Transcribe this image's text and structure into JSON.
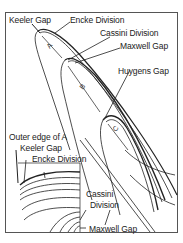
{
  "diagram": {
    "main_labels": [
      {
        "id": "keeler-gap",
        "text": "Keeler Gap"
      },
      {
        "id": "encke-division",
        "text": "Encke Division"
      },
      {
        "id": "cassini-division",
        "text": "Cassini Division"
      },
      {
        "id": "maxwell-gap",
        "text": "Maxwell Gap"
      },
      {
        "id": "huygens-gap",
        "text": "Huygens Gap"
      }
    ],
    "ring_letters": [
      "A",
      "B",
      "C"
    ],
    "inset_labels": [
      {
        "id": "outer-edge-a",
        "text": "Outer edge of A"
      },
      {
        "id": "keeler-gap",
        "text": "Keeler Gap"
      },
      {
        "id": "encke-division",
        "text": "Encke Division"
      },
      {
        "id": "cassini-division-1",
        "text": "Cassini"
      },
      {
        "id": "cassini-division-2",
        "text": "Division"
      },
      {
        "id": "maxwell-gap",
        "text": "Maxwell Gap"
      }
    ],
    "colors": {
      "line": "#222222",
      "background": "#ffffff",
      "frame": "#555555"
    }
  }
}
